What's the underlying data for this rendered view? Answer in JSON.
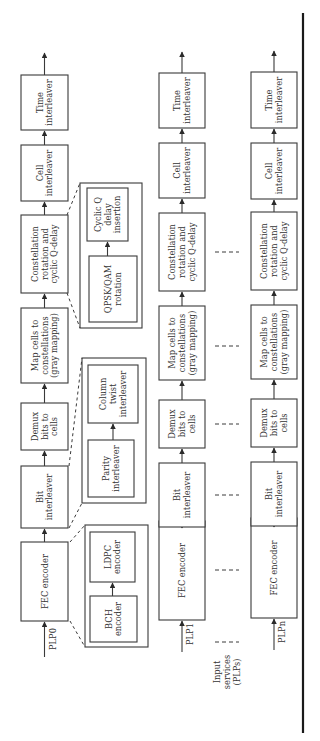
{
  "figure": {
    "orientation": "rotated-90-ccw",
    "columns": [
      {
        "id": "plp0",
        "input_label": "PLP0",
        "blocks": [
          {
            "lines": [
              "FEC encoder"
            ]
          },
          {
            "lines": [
              "Bit",
              "interleaver"
            ]
          },
          {
            "lines": [
              "Demux",
              "bits to",
              "cells"
            ]
          },
          {
            "lines": [
              "Map cells to",
              "constellations",
              "(gray mapping)"
            ]
          },
          {
            "lines": [
              "Constellation",
              "rotation and",
              "cyclic Q-delay"
            ]
          },
          {
            "lines": [
              "Cell",
              "interleaver"
            ]
          },
          {
            "lines": [
              "Time",
              "interleaver"
            ]
          }
        ]
      },
      {
        "id": "plp1",
        "input_label": "PLP1",
        "blocks": [
          {
            "lines": [
              "FEC encoder"
            ]
          },
          {
            "lines": [
              "Bit",
              "interleaver"
            ]
          },
          {
            "lines": [
              "Demux",
              "bits to",
              "cells"
            ]
          },
          {
            "lines": [
              "Map cells to",
              "constellations",
              "(gray mapping)"
            ]
          },
          {
            "lines": [
              "Constellation",
              "rotation and",
              "cyclic Q-delay"
            ]
          },
          {
            "lines": [
              "Cell",
              "interleaver"
            ]
          },
          {
            "lines": [
              "Time",
              "interleaver"
            ]
          }
        ]
      },
      {
        "id": "plpn",
        "input_label": "PLPn",
        "blocks": [
          {
            "lines": [
              "FEC encoder"
            ]
          },
          {
            "lines": [
              "Bit",
              "interleaver"
            ]
          },
          {
            "lines": [
              "Demux",
              "bits to",
              "cells"
            ]
          },
          {
            "lines": [
              "Map cells to",
              "constellations",
              "(gray mapping)"
            ]
          },
          {
            "lines": [
              "Constellation",
              "rotation and",
              "cyclic Q-delay"
            ]
          },
          {
            "lines": [
              "Cell",
              "interleaver"
            ]
          },
          {
            "lines": [
              "Time",
              "interleaver"
            ]
          }
        ]
      }
    ],
    "insets": [
      {
        "id": "constellation-detail",
        "expands": "Constellation rotation and cyclic Q-delay",
        "blocks": [
          {
            "lines": [
              "QPSK/QAM",
              "rotation"
            ]
          },
          {
            "lines": [
              "Cyclic Q",
              "delay",
              "insertion"
            ]
          }
        ]
      },
      {
        "id": "bit-interleaver-detail",
        "expands": "Bit interleaver",
        "blocks": [
          {
            "lines": [
              "Parity",
              "interleaver"
            ]
          },
          {
            "lines": [
              "Column",
              "twist",
              "interleaver"
            ]
          }
        ]
      },
      {
        "id": "fec-detail",
        "expands": "FEC encoder",
        "blocks": [
          {
            "lines": [
              "BCH",
              "encoder"
            ]
          },
          {
            "lines": [
              "LDPC",
              "encoder"
            ]
          }
        ]
      }
    ],
    "input_services_label": [
      "Input",
      "services",
      "(PLPs)"
    ],
    "colors": {
      "stroke": "#3a3a3a",
      "text": "#333333",
      "background": "#ffffff"
    }
  }
}
